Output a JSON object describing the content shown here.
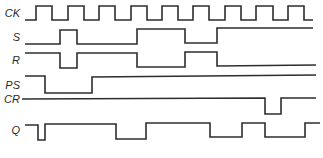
{
  "diagram": {
    "title": "",
    "type": "timing-diagram",
    "colors": {
      "line": "#2e2e2e",
      "label": "#2a2a2a",
      "background": "#ffffff"
    },
    "signals": [
      {
        "name": "CK",
        "label": "CK",
        "label_y": 17,
        "points": "25,20 36,20 36,6 52,6 52,20 68,20 68,6 84,6 84,20 99,20 99,6 115,6 115,20 131,20 131,6 147,6 147,20 162,20 162,6 178,6 178,20 193,20 193,6 209,6 209,20 225,20 225,6 241,6 241,20 256,20 256,6 273,6 273,20 288,20 288,6 304,6 304,20 313,20"
      },
      {
        "name": "S",
        "label": "S",
        "label_y": 41,
        "points": "25,44 60,44 60,30 77,30 77,44 137,44 137,29 185,29 185,43 217,43 217,28 313,28"
      },
      {
        "name": "R",
        "label": "R",
        "label_y": 64,
        "points": "25,53 60,53 60,68 77,68 77,53 137,53 137,67 185,67 185,52 217,52 217,66 316,65"
      },
      {
        "name": "PS",
        "label": "PS",
        "label_y": 89,
        "points": "25,76 45,76 45,93 92,93 92,77 316,75"
      },
      {
        "name": "CR",
        "label": "CR",
        "label_y": 102,
        "points": "22,99 265,98 265,114 281,114 281,98 316,98"
      },
      {
        "name": "Q",
        "label": "Q",
        "label_y": 130,
        "points": "25,125 38,125 38,140 45,140 45,124 116,124 116,139 146,139 146,123 210,123 210,137 242,137 242,123 265,123 265,137 305,137 305,123 320,123"
      }
    ]
  }
}
